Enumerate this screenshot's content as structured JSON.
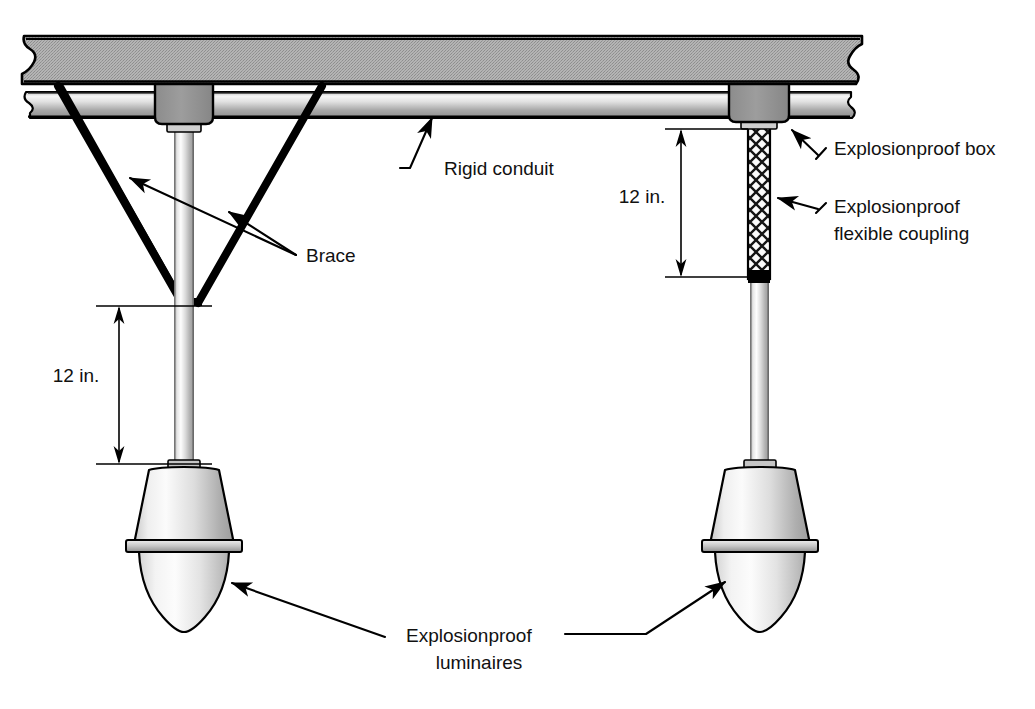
{
  "figure": {
    "type": "technical-illustration",
    "background_color": "#ffffff",
    "line_color": "#000000"
  },
  "labels": {
    "rigid_conduit": "Rigid conduit",
    "brace": "Brace",
    "explosionproof_box": "Explosionproof box",
    "explosionproof_flexible_coupling_line1": "Explosionproof",
    "explosionproof_flexible_coupling_line2": "flexible coupling",
    "explosionproof_luminaires_line1": "Explosionproof",
    "explosionproof_luminaires_line2": "luminaires"
  },
  "dimensions": {
    "left_drop": "12 in.",
    "right_drop": "12 in."
  },
  "colors": {
    "slab_fill": "#a8a8a8",
    "slab_edge": "#000000",
    "conduit_light": "#f2f2f2",
    "conduit_mid": "#b8b8b8",
    "conduit_dark": "#8a8a8a",
    "box_fill": "#8f8f8f",
    "pipe_light": "#ffffff",
    "pipe_mid": "#d8d8d8",
    "pipe_dark": "#9a9a9a",
    "luminaire_light": "#f4f4f4",
    "luminaire_mid": "#dcdcdc",
    "luminaire_dark": "#a5a5a5",
    "brace_color": "#000000",
    "coupling_fill": "#ffffff",
    "coupling_weave": "#1a1a1a"
  },
  "assemblies": [
    {
      "id": "left-assembly",
      "name": "braced-rigid-conduit-luminaire",
      "support_method": "rigid stem with V-brace",
      "dimension": "12 in.",
      "components": [
        "explosionproof box",
        "rigid stem",
        "brace",
        "explosionproof luminaire"
      ]
    },
    {
      "id": "right-assembly",
      "name": "flexible-coupling-luminaire",
      "support_method": "explosionproof flexible coupling",
      "dimension": "12 in.",
      "components": [
        "explosionproof box",
        "explosionproof flexible coupling",
        "rigid stem",
        "explosionproof luminaire"
      ]
    }
  ]
}
